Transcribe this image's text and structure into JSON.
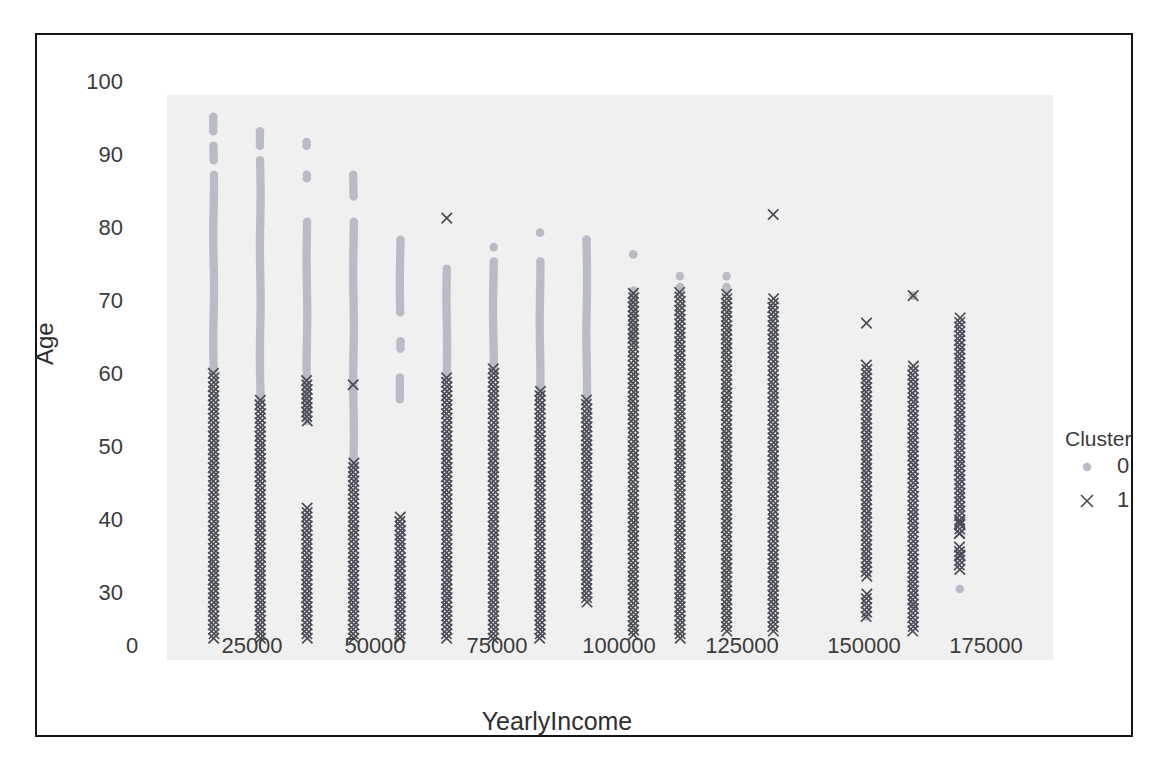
{
  "chart_data": {
    "type": "scatter",
    "title": "",
    "xlabel": "YearlyIncome",
    "ylabel": "Age",
    "xlim": [
      0,
      190000
    ],
    "ylim": [
      25,
      103
    ],
    "xticks": [
      0,
      25000,
      50000,
      75000,
      100000,
      125000,
      150000,
      175000
    ],
    "xticklabels": [
      "0",
      "25000",
      "50000",
      "75000",
      "100000",
      "125000",
      "150000",
      "175000"
    ],
    "yticks": [
      30,
      40,
      50,
      60,
      70,
      80,
      90,
      100
    ],
    "yticklabels": [
      "30",
      "40",
      "50",
      "60",
      "70",
      "80",
      "90",
      "100"
    ],
    "grid": false,
    "legend": {
      "title": "Cluster",
      "position": "right",
      "entries": [
        {
          "label": "0",
          "marker": "circle-marker",
          "color": "#b9bcc4"
        },
        {
          "label": "1",
          "marker": "x-marker",
          "color": "#4a4d55"
        }
      ]
    },
    "note": "Dense vertical stripes of points at discrete YearlyIncome values; each stripe has a cluster-0 (dot) upper segment and a cluster-1 (x) lower segment.",
    "series": [
      {
        "name": "0",
        "marker": "circle-marker",
        "color": "#b9bcc4",
        "columns": [
          {
            "x": 10000,
            "y_ranges": [
              [
                65,
                100
              ]
            ],
            "gaps": [
              [
                92.5,
                93.5
              ],
              [
                96.5,
                97.5
              ]
            ]
          },
          {
            "x": 20000,
            "y_ranges": [
              [
                61,
                98
              ]
            ],
            "gaps": [
              [
                94.5,
                95.5
              ]
            ]
          },
          {
            "x": 30000,
            "y_ranges": [
              [
                58,
                96.5
              ]
            ],
            "gaps": [
              [
                86,
                91
              ],
              [
                92.5,
                95.5
              ]
            ]
          },
          {
            "x": 40000,
            "y_ranges": [
              [
                52,
                92
              ]
            ],
            "gaps": [
              [
                86,
                88.5
              ]
            ]
          },
          {
            "x": 50000,
            "y_ranges": [
              [
                61,
                83
              ]
            ],
            "gaps": [
              [
                69.5,
                72.5
              ],
              [
                64.5,
                67.5
              ]
            ]
          },
          {
            "x": 60000,
            "y_ranges": [
              [
                64,
                79
              ]
            ],
            "gaps": []
          },
          {
            "x": 70000,
            "y_ranges": [
              [
                65,
                82
              ]
            ],
            "gaps": [
              [
                80.5,
                81.5
              ]
            ]
          },
          {
            "x": 80000,
            "y_ranges": [
              [
                62,
                80
              ]
            ],
            "gaps": [
              [
                81.5,
                84.5
              ]
            ]
          },
          {
            "x": 90000,
            "y_ranges": [
              [
                61,
                83
              ]
            ],
            "gaps": []
          },
          {
            "x": 100000,
            "y_ranges": [
              [
                69,
                76
              ]
            ],
            "gaps": []
          },
          {
            "x": 110000,
            "y_ranges": [
              [
                76,
                76.5
              ]
            ],
            "gaps": []
          },
          {
            "x": 120000,
            "y_ranges": [
              [
                76,
                76.5
              ]
            ],
            "gaps": []
          }
        ],
        "single_points": [
          {
            "x": 100000,
            "y": 81
          },
          {
            "x": 110000,
            "y": 78
          },
          {
            "x": 120000,
            "y": 78
          },
          {
            "x": 30000,
            "y": 84.5
          },
          {
            "x": 40000,
            "y": 84
          },
          {
            "x": 80000,
            "y": 84
          },
          {
            "x": 90000,
            "y": 83
          },
          {
            "x": 160000,
            "y": 75.3
          },
          {
            "x": 150000,
            "y": 31
          },
          {
            "x": 160000,
            "y": 32.5
          },
          {
            "x": 170000,
            "y": 34.8
          }
        ]
      },
      {
        "name": "1",
        "marker": "x-marker",
        "color": "#4a4d55",
        "columns": [
          {
            "x": 10000,
            "y_ranges": [
              [
                28,
                65
              ]
            ],
            "gaps": []
          },
          {
            "x": 20000,
            "y_ranges": [
              [
                28,
                61
              ]
            ],
            "gaps": []
          },
          {
            "x": 30000,
            "y_ranges": [
              [
                28,
                46
              ],
              [
                58,
                64
              ]
            ],
            "gaps": []
          },
          {
            "x": 40000,
            "y_ranges": [
              [
                28,
                52.5
              ],
              [
                63,
                63.5
              ]
            ],
            "gaps": []
          },
          {
            "x": 50000,
            "y_ranges": [
              [
                28,
                45
              ]
            ],
            "gaps": []
          },
          {
            "x": 60000,
            "y_ranges": [
              [
                28,
                64.5
              ]
            ],
            "gaps": []
          },
          {
            "x": 70000,
            "y_ranges": [
              [
                28,
                65.5
              ]
            ],
            "gaps": []
          },
          {
            "x": 80000,
            "y_ranges": [
              [
                28,
                62.5
              ]
            ],
            "gaps": []
          },
          {
            "x": 90000,
            "y_ranges": [
              [
                33,
                61.5
              ]
            ],
            "gaps": []
          },
          {
            "x": 100000,
            "y_ranges": [
              [
                28.5,
                76
              ]
            ],
            "gaps": []
          },
          {
            "x": 110000,
            "y_ranges": [
              [
                28,
                76.3
              ]
            ],
            "gaps": []
          },
          {
            "x": 120000,
            "y_ranges": [
              [
                29,
                76
              ]
            ],
            "gaps": []
          },
          {
            "x": 130000,
            "y_ranges": [
              [
                29,
                75
              ]
            ],
            "gaps": []
          },
          {
            "x": 150000,
            "y_ranges": [
              [
                31,
                66
              ]
            ],
            "gaps": [
              [
                34.5,
                36
              ]
            ]
          },
          {
            "x": 160000,
            "y_ranges": [
              [
                29,
                66
              ]
            ],
            "gaps": []
          },
          {
            "x": 170000,
            "y_ranges": [
              [
                37.5,
                72.5
              ]
            ],
            "gaps": [
              [
                41,
                42
              ]
            ]
          }
        ],
        "single_points": [
          {
            "x": 60000,
            "y": 86
          },
          {
            "x": 130000,
            "y": 86.5
          },
          {
            "x": 150000,
            "y": 71.5
          },
          {
            "x": 160000,
            "y": 75.3
          },
          {
            "x": 170000,
            "y": 44
          },
          {
            "x": 170000,
            "y": 42.5
          },
          {
            "x": 170000,
            "y": 39.5
          }
        ]
      }
    ]
  },
  "style": {
    "panel_bg": "#f0f0f0",
    "frame_color": "#15161a",
    "tick_color": "#3b3b3b",
    "cluster0_color": "#b9bcc4",
    "cluster1_color": "#4a4d55"
  }
}
